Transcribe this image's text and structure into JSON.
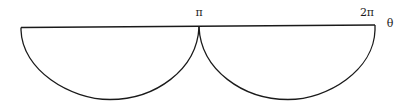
{
  "diagram": {
    "axis_label": "θ",
    "tick_labels": [
      "π",
      "2π"
    ],
    "curves": [
      {
        "name": "arc-0-to-pi",
        "from": "0",
        "to": "π",
        "shape": "lower semi-ellipse"
      },
      {
        "name": "arc-pi-to-2pi",
        "from": "π",
        "to": "2π",
        "shape": "lower semi-ellipse"
      }
    ],
    "stroke_color": "#1a1a1a",
    "background_color": "#ffffff"
  }
}
